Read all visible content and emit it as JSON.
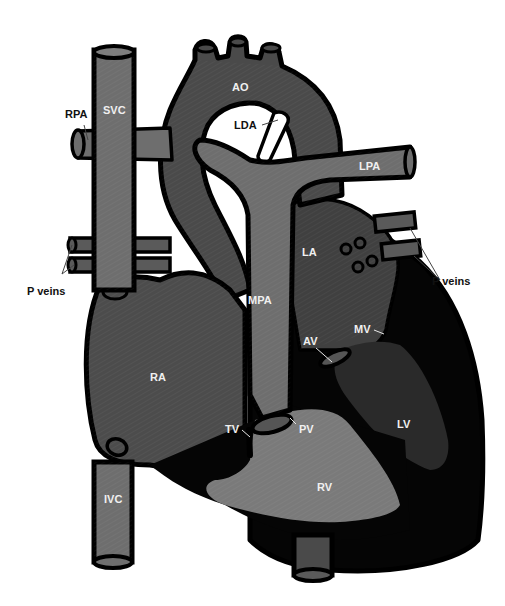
{
  "figure": {
    "type": "cardiac anatomy schematic",
    "colors": {
      "background": "#ffffff",
      "outline": "#000000",
      "vessel_light": "#6e6e6e",
      "aorta_dark": "#4a4a4a",
      "atrium_right": "#4c4c4c",
      "atrium_left": "#404040",
      "ventricle_right": "#7a7a7a",
      "ventricle_left": "#2a2a2a",
      "myocardium": "#050505",
      "label_on_dark": "#f0f0f0",
      "label_on_white": "#111111"
    },
    "labels": {
      "ao": "AO",
      "lda": "LDA",
      "rpa": "RPA",
      "svc": "SVC",
      "lpa": "LPA",
      "la": "LA",
      "p_veins_left": "P veins",
      "p_veins_right": "P veins",
      "mpa": "MPA",
      "mv": "MV",
      "av": "AV",
      "ra": "RA",
      "tv": "TV",
      "pv": "PV",
      "lv": "LV",
      "rv": "RV",
      "ivc": "IVC"
    }
  }
}
